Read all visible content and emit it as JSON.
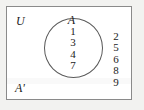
{
  "figure": {
    "type": "venn-diagram",
    "universe_label": "U",
    "set_label": "A",
    "complement_label": "A'",
    "inside_members": [
      "1",
      "3",
      "4",
      "7"
    ],
    "outside_members": [
      "2",
      "5",
      "6",
      "8",
      "9"
    ],
    "colors": {
      "page_background": "#f2f2f0",
      "box_background": "#ffffff",
      "box_border": "#8a8a8a",
      "circle_stroke": "#5a5a5a",
      "text": "#1b1b1b"
    }
  }
}
